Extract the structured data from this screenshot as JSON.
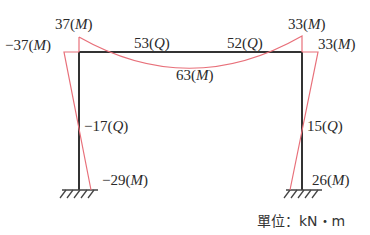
{
  "diagram": {
    "type": "portal frame bending moment and shear diagram",
    "colors": {
      "frame": "#333333",
      "moment_line": "#e8707a"
    },
    "labels": {
      "left_top_moment": {
        "value": "37",
        "kind": "M",
        "text": "37(M)"
      },
      "left_side_moment": {
        "value": "−37",
        "kind": "M",
        "text": "−37(M)"
      },
      "beam_left_shear": {
        "value": "53",
        "kind": "Q",
        "text": "53(Q)"
      },
      "beam_right_shear": {
        "value": "52",
        "kind": "Q",
        "text": "52(Q)"
      },
      "right_top_moment": {
        "value": "33",
        "kind": "M",
        "text": "33(M)"
      },
      "right_side_moment": {
        "value": "33",
        "kind": "M",
        "text": "33(M)"
      },
      "beam_mid_moment": {
        "value": "63",
        "kind": "M",
        "text": "63(M)"
      },
      "left_column_shear": {
        "value": "−17",
        "kind": "Q",
        "text": "−17(Q)"
      },
      "right_column_shear": {
        "value": "15",
        "kind": "Q",
        "text": "15(Q)"
      },
      "left_base_moment": {
        "value": "−29",
        "kind": "M",
        "text": "−29(M)"
      },
      "right_base_moment": {
        "value": "26",
        "kind": "M",
        "text": "26(M)"
      }
    },
    "unit": "單位：kN・m"
  }
}
